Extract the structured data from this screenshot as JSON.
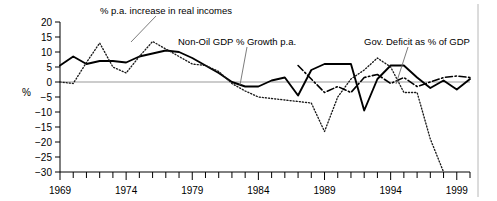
{
  "chart_data": {
    "type": "line",
    "title": "",
    "xlabel": "",
    "ylabel": "%",
    "ylim": [
      -30,
      20
    ],
    "xlim": [
      1969,
      2000
    ],
    "grid": false,
    "legend_position": "inline-annotations",
    "y_ticks": [
      "20",
      "15",
      "10",
      "5",
      "0",
      "−5",
      "−10",
      "−15",
      "−20",
      "−25",
      "−30"
    ],
    "y_tick_values": [
      20,
      15,
      10,
      5,
      0,
      -5,
      -10,
      -15,
      -20,
      -25,
      -30
    ],
    "x_ticks": [
      "1969",
      "1974",
      "1979",
      "1984",
      "1989",
      "1994",
      "1999"
    ],
    "x_tick_values": [
      1969,
      1974,
      1979,
      1984,
      1989,
      1994,
      1999
    ],
    "x_minor_step": 1,
    "annotations": [
      {
        "text": "% p.a. increase in real incomes",
        "series": "real_incomes"
      },
      {
        "text": "Non-Oil GDP % Growth p.a.",
        "series": "non_oil_gdp"
      },
      {
        "text": "Gov. Deficit as % of GDP",
        "series": "gov_deficit"
      }
    ],
    "series": [
      {
        "name": "Non-Oil GDP % Growth p.a.",
        "style": "solid",
        "x": [
          1969,
          1970,
          1971,
          1972,
          1973,
          1974,
          1975,
          1976,
          1977,
          1978,
          1979,
          1980,
          1981,
          1982,
          1983,
          1984,
          1985,
          1986,
          1987,
          1988,
          1989,
          1990,
          1991,
          1992,
          1993,
          1994,
          1995,
          1996,
          1997,
          1998,
          1999,
          2000
        ],
        "values": [
          5.5,
          8.5,
          6.0,
          7.0,
          7.0,
          6.5,
          8.5,
          9.5,
          10.5,
          10.0,
          8.0,
          5.5,
          3.0,
          0.0,
          -1.5,
          -1.5,
          0.5,
          1.5,
          -4.5,
          4.0,
          6.0,
          6.0,
          6.0,
          -9.5,
          1.0,
          5.5,
          5.5,
          1.5,
          -2.0,
          0.5,
          -2.5,
          1.0
        ]
      },
      {
        "name": "% p.a. increase in real incomes",
        "style": "dotted",
        "x": [
          1969,
          1970,
          1971,
          1972,
          1973,
          1974,
          1975,
          1976,
          1977,
          1978,
          1979,
          1980,
          1981,
          1982,
          1983,
          1984,
          1985,
          1986,
          1987,
          1988,
          1989,
          1990,
          1991,
          1992,
          1993,
          1994,
          1995,
          1996,
          1997,
          1998
        ],
        "values": [
          0.0,
          -0.5,
          6.5,
          13.0,
          5.0,
          3.0,
          8.5,
          13.5,
          11.0,
          8.5,
          6.0,
          5.5,
          3.5,
          -0.5,
          -3.0,
          -5.0,
          -5.5,
          -6.0,
          -6.5,
          -7.0,
          -16.5,
          -5.0,
          1.0,
          4.0,
          8.0,
          5.0,
          -3.5,
          -3.5,
          -19.0,
          -32.0
        ]
      },
      {
        "name": "Gov. Deficit as % of GDP",
        "style": "dash-dot",
        "x": [
          1987,
          1988,
          1989,
          1990,
          1991,
          1992,
          1993,
          1994,
          1995,
          1996,
          1997,
          1998,
          1999,
          2000
        ],
        "values": [
          5.5,
          1.0,
          -3.5,
          -1.5,
          -3.5,
          1.5,
          2.5,
          -0.5,
          1.5,
          -1.5,
          0.0,
          1.5,
          2.0,
          1.5
        ]
      }
    ]
  },
  "axis": {
    "y_label": "%"
  }
}
